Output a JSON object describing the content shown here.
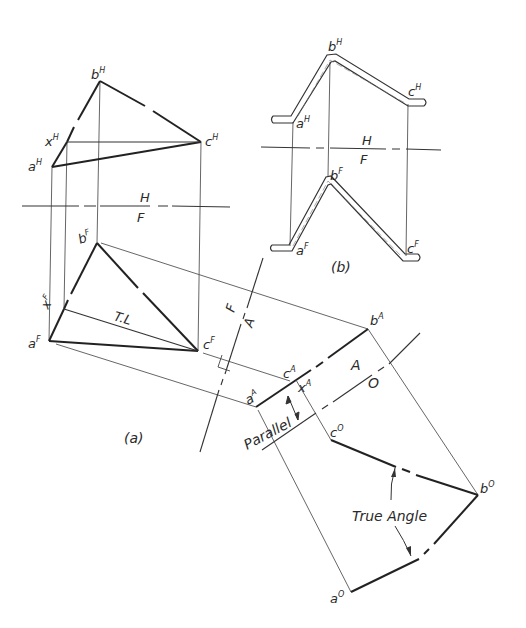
{
  "figure": {
    "view_a_caption": "(a)",
    "view_b_caption": "(b)"
  },
  "colors": {
    "ink": "#2a2a2a",
    "thin": "#555555",
    "background": "#ffffff"
  },
  "view_a": {
    "top_view": {
      "plane_label_above": "H",
      "plane_label_below": "F",
      "points": {
        "a": {
          "label": "a",
          "sup": "H",
          "x": 52,
          "y": 167
        },
        "b": {
          "label": "b",
          "sup": "H",
          "x": 100,
          "y": 81
        },
        "c": {
          "label": "c",
          "sup": "H",
          "x": 201,
          "y": 142
        },
        "x": {
          "label": "x",
          "sup": "H",
          "x": 67,
          "y": 142
        }
      }
    },
    "front_view": {
      "points": {
        "a": {
          "label": "a",
          "sup": "F",
          "x": 49,
          "y": 341
        },
        "b": {
          "label": "b",
          "sup": "F",
          "x": 97,
          "y": 243
        },
        "c": {
          "label": "c",
          "sup": "F",
          "x": 198,
          "y": 351
        },
        "x": {
          "label": "x",
          "sup": "F",
          "x": 64,
          "y": 309
        }
      },
      "true_length_label": "T.L"
    },
    "fold_line_FA": {
      "label_F": "F",
      "label_A": "A"
    },
    "auxiliary_view": {
      "points": {
        "a": {
          "label": "a",
          "sup": "A",
          "x": 256,
          "y": 407
        },
        "b": {
          "label": "b",
          "sup": "A",
          "x": 368,
          "y": 329
        },
        "c": {
          "label": "c",
          "sup": "A",
          "x": 290,
          "y": 383
        },
        "x": {
          "label": "x",
          "sup": "A"
        }
      },
      "parallel_label": "Parallel"
    },
    "fold_line_AO": {
      "label_A": "A",
      "label_O": "O"
    },
    "oblique_view": {
      "points": {
        "a": {
          "label": "a",
          "sup": "O",
          "x": 351,
          "y": 592
        },
        "b": {
          "label": "b",
          "sup": "O",
          "x": 478,
          "y": 495
        },
        "c": {
          "label": "c",
          "sup": "O",
          "x": 331,
          "y": 440
        }
      },
      "angle_label": "True Angle"
    }
  },
  "view_b": {
    "plane_label_above": "H",
    "plane_label_below": "F",
    "top_view": {
      "a": {
        "label": "a",
        "sup": "H"
      },
      "b": {
        "label": "b",
        "sup": "H"
      },
      "c": {
        "label": "c",
        "sup": "H"
      }
    },
    "front_view": {
      "a": {
        "label": "a",
        "sup": "F"
      },
      "b": {
        "label": "b",
        "sup": "F"
      },
      "c": {
        "label": "c",
        "sup": "F"
      }
    }
  }
}
